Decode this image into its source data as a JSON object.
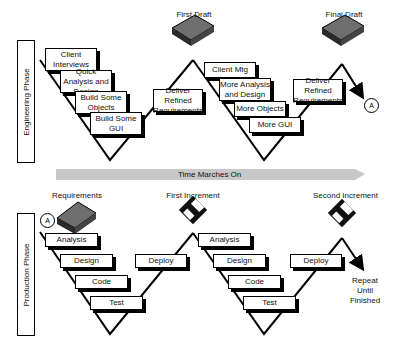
{
  "phases": {
    "engineering": "Engineering Phase",
    "production": "Production Phase"
  },
  "timeline": {
    "label": "Time Marches On",
    "color": "#c8c8c8"
  },
  "engineering": {
    "first_draft_label": "First Draft",
    "final_draft_label": "Final Draft",
    "cycle1": {
      "steps": [
        "Client Interviews",
        "Quick Analysis and Design",
        "Build Some Objects",
        "Build Some GUI"
      ],
      "deliver": "Deliver Refined Requirements"
    },
    "cycle2": {
      "steps": [
        "Client Mtg",
        "More Analysis and Design",
        "More Objects",
        "More GUI"
      ],
      "deliver": "Deliver Refined Requirements"
    },
    "connector": "A"
  },
  "production": {
    "requirements_label": "Requirements",
    "first_increment_label": "First Increment",
    "second_increment_label": "Second Increment",
    "connector": "A",
    "cycle1": {
      "steps": [
        "Analysis",
        "Design",
        "Code",
        "Test"
      ],
      "deploy": "Deploy"
    },
    "cycle2": {
      "steps": [
        "Analysis",
        "Design",
        "Code",
        "Test"
      ],
      "deploy": "Deploy"
    },
    "repeat_label": "Repeat Until Finished"
  },
  "colors": {
    "book": "#6e6e6e",
    "book_dark": "#2a2a2a",
    "disk": "#111111",
    "line": "#000000"
  }
}
